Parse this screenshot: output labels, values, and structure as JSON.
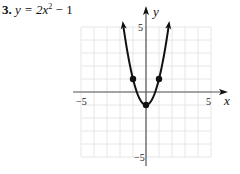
{
  "problem": {
    "number": "3.",
    "equation": "y = 2x",
    "exponent": "2",
    "tail": " − 1"
  },
  "chart_data": {
    "type": "line",
    "function": "y = 2x^2 - 1",
    "xlabel": "x",
    "ylabel": "y",
    "xlim": [
      -5,
      5
    ],
    "ylim": [
      -5,
      5
    ],
    "grid": true,
    "x_tick_labels": [
      "−5",
      "5"
    ],
    "y_tick_labels": [
      "5",
      "−5"
    ],
    "curve": {
      "x": [
        -1.73,
        -1.5,
        -1,
        -0.5,
        0,
        0.5,
        1,
        1.5,
        1.73
      ],
      "y": [
        5,
        3.5,
        1,
        -0.5,
        -1,
        -0.5,
        1,
        3.5,
        5
      ],
      "arrows_at_ends": true
    },
    "points": [
      {
        "x": -1,
        "y": 1
      },
      {
        "x": 0,
        "y": -1
      },
      {
        "x": 1,
        "y": 1
      }
    ]
  }
}
